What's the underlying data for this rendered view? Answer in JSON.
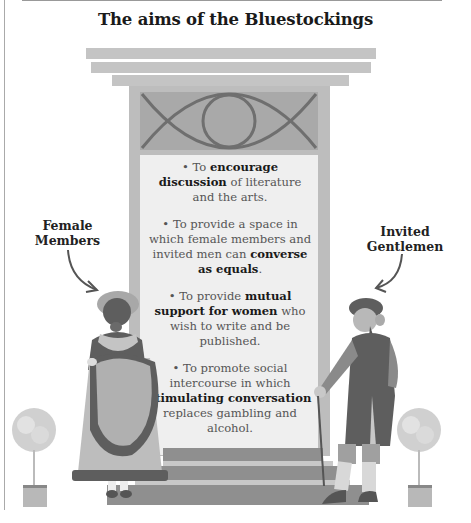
{
  "title": "The aims of the Bluestockings",
  "aims": [
    {
      "pre": "To ",
      "bold": "encourage discussion",
      "post": " of literature and the arts."
    },
    {
      "pre": "To provide a space in which female members and invited men can ",
      "bold": "converse as equals",
      "post": "."
    },
    {
      "pre": "To provide ",
      "bold": "mutual support for women",
      "post": " who wish to write and be published."
    },
    {
      "pre": "To promote social intercourse in which ",
      "bold": "stimulating conversation",
      "post": " replaces gambling and alcohol."
    }
  ],
  "labels": {
    "female": [
      "Female",
      "Members"
    ],
    "male": [
      "Invited",
      "Gentlemen"
    ]
  },
  "colors": {
    "dark": "#5e5e5e",
    "mid": "#8a8a8a",
    "light": "#bdbdbd",
    "panel": "#efefef"
  }
}
